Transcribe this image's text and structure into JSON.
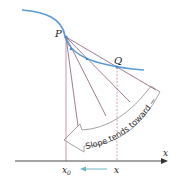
{
  "diagram": {
    "title": "",
    "labels": {
      "point_p": "P",
      "point_q": "Q",
      "axis_x": "x",
      "tick_x0": "x",
      "tick_x0_sub": "0",
      "tick_x": "x",
      "arrow_text": "Slope tends toward −∞"
    },
    "colors": {
      "curve": "#5b9bd5",
      "secant": "#8a5a7a",
      "vertical": "#c98aa6",
      "dashed": "#c98aa6",
      "axis": "#333333",
      "approach_arrow": "#6fb6c0",
      "big_arrow_stroke": "#9a9a9a",
      "point": "#4a86c5"
    },
    "secant_count": 5
  }
}
